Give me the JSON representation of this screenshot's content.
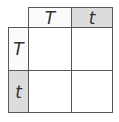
{
  "punnett_square": {
    "top_alleles": [
      "T",
      "t"
    ],
    "left_alleles": [
      "T",
      "t"
    ],
    "cells": [
      [
        "",
        ""
      ],
      [
        "",
        ""
      ]
    ],
    "colors": {
      "dominant_header": "#fbfbfb",
      "recessive_header": "#dcdcdc",
      "border": "#5a5a5a"
    }
  }
}
